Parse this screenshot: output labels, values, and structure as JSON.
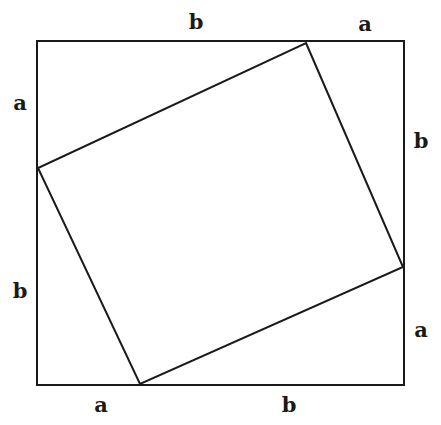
{
  "figure": {
    "background_color": "#ffffff",
    "stroke_color": "#1a1a1a",
    "stroke_width": 2,
    "canvas": {
      "width": 441,
      "height": 425
    }
  },
  "outer_square": {
    "name": "outer-square",
    "points": "37,41 404,41 404,385 37,385",
    "corners": {
      "top_left": [
        37,
        41
      ],
      "top_right": [
        404,
        41
      ],
      "bottom_right": [
        404,
        385
      ],
      "bottom_left": [
        37,
        385
      ]
    },
    "side_length_px": 367
  },
  "inner_square": {
    "name": "inner-square",
    "points": "306,43 403,267 140,384 38,168",
    "vertices": {
      "top": [
        306,
        43
      ],
      "right": [
        403,
        267
      ],
      "bottom": [
        140,
        384
      ],
      "left": [
        38,
        168
      ]
    }
  },
  "labels": [
    {
      "id": "label-top-b",
      "text": "b",
      "x": 196,
      "y": 21,
      "side": "top",
      "segment": "b"
    },
    {
      "id": "label-top-a",
      "text": "a",
      "x": 365,
      "y": 23,
      "side": "top",
      "segment": "a"
    },
    {
      "id": "label-left-a",
      "text": "a",
      "x": 20,
      "y": 102,
      "side": "left",
      "segment": "a"
    },
    {
      "id": "label-right-b",
      "text": "b",
      "x": 421,
      "y": 140,
      "side": "right",
      "segment": "b"
    },
    {
      "id": "label-left-b",
      "text": "b",
      "x": 20,
      "y": 290,
      "side": "left",
      "segment": "b"
    },
    {
      "id": "label-right-a",
      "text": "a",
      "x": 421,
      "y": 329,
      "side": "right",
      "segment": "a"
    },
    {
      "id": "label-bottom-a",
      "text": "a",
      "x": 101,
      "y": 404,
      "side": "bottom",
      "segment": "a"
    },
    {
      "id": "label-bottom-b",
      "text": "b",
      "x": 289,
      "y": 404,
      "side": "bottom",
      "segment": "b"
    }
  ]
}
